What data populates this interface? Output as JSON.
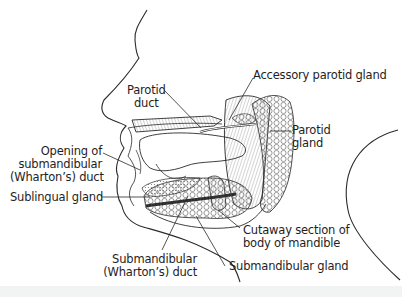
{
  "diagram": {
    "type": "anatomical-illustration",
    "colors": {
      "line": "#2a2a2a",
      "background": "#ffffff",
      "text": "#1e1e1e"
    },
    "labels": {
      "parotid_duct": {
        "line1": "Parotid",
        "line2": "duct"
      },
      "accessory_parotid_gland": "Accessory parotid gland",
      "parotid_gland": {
        "line1": "Parotid",
        "line2": "gland"
      },
      "opening_submandibular_duct": {
        "line1": "Opening of",
        "line2": "submandibular",
        "line3": "(Wharton’s) duct"
      },
      "sublingual_gland": "Sublingual gland",
      "cutaway_section": {
        "line1": "Cutaway section of",
        "line2": "body of mandible"
      },
      "submandibular_duct": {
        "line1": "Submandibular",
        "line2": "(Wharton’s) duct"
      },
      "submandibular_gland": "Submandibular gland"
    }
  }
}
